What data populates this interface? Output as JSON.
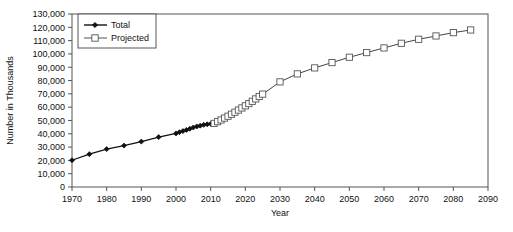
{
  "chart_data": {
    "type": "line",
    "title": "",
    "xlabel": "Year",
    "ylabel": "Number in Thousands",
    "xlim": [
      1970,
      2090
    ],
    "ylim": [
      0,
      130000
    ],
    "xticks": [
      1970,
      1980,
      1990,
      2000,
      2010,
      2020,
      2030,
      2040,
      2050,
      2060,
      2070,
      2080,
      2090
    ],
    "yticks": [
      0,
      10000,
      20000,
      30000,
      40000,
      50000,
      60000,
      70000,
      80000,
      90000,
      100000,
      110000,
      120000,
      130000
    ],
    "ytick_labels": [
      "0",
      "10,000",
      "20,000",
      "30,000",
      "40,000",
      "50,000",
      "60,000",
      "70,000",
      "80,000",
      "90,000",
      "100,000",
      "110,000",
      "120,000",
      "130,000"
    ],
    "xtick_labels": [
      "1970",
      "1980",
      "1990",
      "2000",
      "2010",
      "2020",
      "2030",
      "2040",
      "2050",
      "2060",
      "2070",
      "2080",
      "2090"
    ],
    "grid": false,
    "legend_position": "upper-left",
    "series": [
      {
        "name": "Total",
        "marker": "filled-diamond",
        "color": "#111111",
        "x": [
          1970,
          1975,
          1980,
          1985,
          1990,
          1995,
          2000,
          2001,
          2002,
          2003,
          2004,
          2005,
          2006,
          2007,
          2008,
          2009,
          2010,
          2011
        ],
        "values": [
          20107,
          24700,
          28500,
          31100,
          34100,
          37500,
          40270,
          41200,
          42000,
          42900,
          43800,
          44700,
          45500,
          46100,
          46700,
          47100,
          47500,
          47800
        ]
      },
      {
        "name": "Projected",
        "marker": "open-square",
        "color": "#555555",
        "x": [
          2011,
          2012,
          2013,
          2014,
          2015,
          2016,
          2017,
          2018,
          2019,
          2020,
          2021,
          2022,
          2023,
          2024,
          2025,
          2030,
          2035,
          2040,
          2045,
          2050,
          2055,
          2060,
          2065,
          2070,
          2075,
          2080,
          2085
        ],
        "values": [
          47800,
          49100,
          50400,
          51800,
          53200,
          54700,
          56200,
          57800,
          59400,
          61000,
          62700,
          64400,
          66200,
          68000,
          69800,
          79000,
          85000,
          89500,
          93500,
          97500,
          101000,
          104500,
          108000,
          111000,
          113500,
          116000,
          118000
        ]
      }
    ]
  },
  "legend": {
    "items": [
      {
        "label": "Total"
      },
      {
        "label": "Projected"
      }
    ]
  },
  "axes": {
    "x_title": "Year",
    "y_title": "Number in Thousands"
  }
}
